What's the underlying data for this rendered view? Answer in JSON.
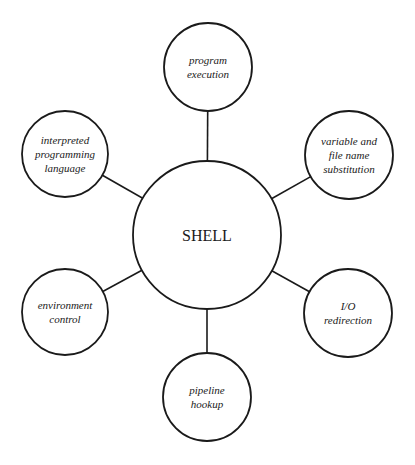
{
  "diagram": {
    "type": "hub-and-spoke",
    "center": {
      "id": "shell",
      "label": "SHELL",
      "cx": 207,
      "cy": 235,
      "r": 74
    },
    "nodes": [
      {
        "id": "program-execution",
        "lines": [
          "program",
          "execution"
        ],
        "cx": 208,
        "cy": 67,
        "r": 44
      },
      {
        "id": "variable-file-name-substitution",
        "lines": [
          "variable and",
          "file name",
          "substitution"
        ],
        "cx": 349,
        "cy": 155,
        "r": 44
      },
      {
        "id": "io-redirection",
        "lines": [
          "I/O",
          "redirection"
        ],
        "cx": 348,
        "cy": 313,
        "r": 44
      },
      {
        "id": "pipeline-hookup",
        "lines": [
          "pipeline",
          "hookup"
        ],
        "cx": 207,
        "cy": 397,
        "r": 44
      },
      {
        "id": "environment-control",
        "lines": [
          "environment",
          "control"
        ],
        "cx": 65,
        "cy": 312,
        "r": 43
      },
      {
        "id": "interpreted-programming-language",
        "lines": [
          "interpreted",
          "programming",
          "language"
        ],
        "cx": 65,
        "cy": 154,
        "r": 43
      }
    ],
    "edges": [
      {
        "from": "shell",
        "to": "program-execution"
      },
      {
        "from": "shell",
        "to": "variable-file-name-substitution"
      },
      {
        "from": "shell",
        "to": "io-redirection"
      },
      {
        "from": "shell",
        "to": "pipeline-hookup"
      },
      {
        "from": "shell",
        "to": "environment-control"
      },
      {
        "from": "shell",
        "to": "interpreted-programming-language"
      }
    ],
    "colors": {
      "stroke": "#1a1a1a",
      "fill": "#ffffff",
      "background": "#ffffff"
    }
  }
}
